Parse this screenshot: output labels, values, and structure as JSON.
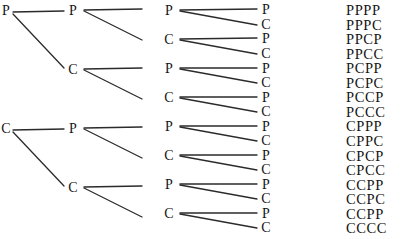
{
  "diagram": {
    "width": 413,
    "height": 239,
    "background": "#ffffff",
    "line_color": "#2b2b2b",
    "text_color": "#141414",
    "labels": {
      "p": "P",
      "c": "C"
    },
    "columns": [
      {
        "name": "stage-1",
        "x": 6,
        "nodes": [
          {
            "label": "P",
            "y": 11
          },
          {
            "label": "C",
            "y": 129
          }
        ]
      },
      {
        "name": "stage-2",
        "x": 73,
        "nodes": [
          {
            "label": "P",
            "y": 11
          },
          {
            "label": "C",
            "y": 70
          },
          {
            "label": "P",
            "y": 129
          },
          {
            "label": "C",
            "y": 188
          }
        ]
      },
      {
        "name": "stage-3",
        "x": 169,
        "nodes": [
          {
            "label": "P",
            "y": 11
          },
          {
            "label": "C",
            "y": 40
          },
          {
            "label": "P",
            "y": 69
          },
          {
            "label": "C",
            "y": 98
          },
          {
            "label": "P",
            "y": 127
          },
          {
            "label": "C",
            "y": 156
          },
          {
            "label": "P",
            "y": 185
          },
          {
            "label": "C",
            "y": 214
          }
        ]
      },
      {
        "name": "stage-4",
        "x": 266,
        "nodes": [
          {
            "label": "P",
            "y": 10
          },
          {
            "label": "C",
            "y": 25
          },
          {
            "label": "P",
            "y": 39
          },
          {
            "label": "C",
            "y": 54
          },
          {
            "label": "P",
            "y": 69
          },
          {
            "label": "C",
            "y": 83
          },
          {
            "label": "P",
            "y": 98
          },
          {
            "label": "C",
            "y": 112
          },
          {
            "label": "P",
            "y": 127
          },
          {
            "label": "C",
            "y": 141
          },
          {
            "label": "P",
            "y": 156
          },
          {
            "label": "C",
            "y": 170
          },
          {
            "label": "P",
            "y": 185
          },
          {
            "label": "C",
            "y": 199
          },
          {
            "label": "P",
            "y": 214
          },
          {
            "label": "C",
            "y": 228
          }
        ]
      }
    ],
    "edges": [
      {
        "x1": 13,
        "y1": 12,
        "x2": 64,
        "y2": 11
      },
      {
        "x1": 13,
        "y1": 14,
        "x2": 64,
        "y2": 68
      },
      {
        "x1": 13,
        "y1": 130,
        "x2": 64,
        "y2": 129
      },
      {
        "x1": 13,
        "y1": 132,
        "x2": 64,
        "y2": 186
      },
      {
        "x1": 84,
        "y1": 10,
        "x2": 142,
        "y2": 9
      },
      {
        "x1": 84,
        "y1": 11,
        "x2": 142,
        "y2": 40
      },
      {
        "x1": 84,
        "y1": 69,
        "x2": 142,
        "y2": 68
      },
      {
        "x1": 84,
        "y1": 70,
        "x2": 142,
        "y2": 99
      },
      {
        "x1": 84,
        "y1": 128,
        "x2": 142,
        "y2": 127
      },
      {
        "x1": 84,
        "y1": 129,
        "x2": 142,
        "y2": 158
      },
      {
        "x1": 84,
        "y1": 187,
        "x2": 142,
        "y2": 186
      },
      {
        "x1": 84,
        "y1": 188,
        "x2": 142,
        "y2": 217
      },
      {
        "x1": 180,
        "y1": 10,
        "x2": 257,
        "y2": 9
      },
      {
        "x1": 180,
        "y1": 11,
        "x2": 257,
        "y2": 25
      },
      {
        "x1": 180,
        "y1": 39,
        "x2": 257,
        "y2": 38
      },
      {
        "x1": 180,
        "y1": 40,
        "x2": 257,
        "y2": 54
      },
      {
        "x1": 180,
        "y1": 68,
        "x2": 257,
        "y2": 68
      },
      {
        "x1": 180,
        "y1": 69,
        "x2": 257,
        "y2": 83
      },
      {
        "x1": 180,
        "y1": 97,
        "x2": 257,
        "y2": 97
      },
      {
        "x1": 180,
        "y1": 98,
        "x2": 257,
        "y2": 112
      },
      {
        "x1": 180,
        "y1": 126,
        "x2": 257,
        "y2": 126
      },
      {
        "x1": 180,
        "y1": 127,
        "x2": 257,
        "y2": 141
      },
      {
        "x1": 180,
        "y1": 155,
        "x2": 257,
        "y2": 155
      },
      {
        "x1": 180,
        "y1": 156,
        "x2": 257,
        "y2": 170
      },
      {
        "x1": 180,
        "y1": 184,
        "x2": 257,
        "y2": 184
      },
      {
        "x1": 180,
        "y1": 185,
        "x2": 257,
        "y2": 199
      },
      {
        "x1": 180,
        "y1": 213,
        "x2": 257,
        "y2": 213
      },
      {
        "x1": 180,
        "y1": 214,
        "x2": 257,
        "y2": 228
      }
    ],
    "outcomes": {
      "x": 346,
      "start_y": 10,
      "step_y": 14.55,
      "items": [
        "PPPP",
        "PPPC",
        "PPCP",
        "PPCC",
        "PCPP",
        "PCPC",
        "PCCP",
        "PCCC",
        "CPPP",
        "CPPC",
        "CPCP",
        "CPCC",
        "CCPP",
        "CCPC",
        "CCPP",
        "CCCC"
      ]
    }
  }
}
